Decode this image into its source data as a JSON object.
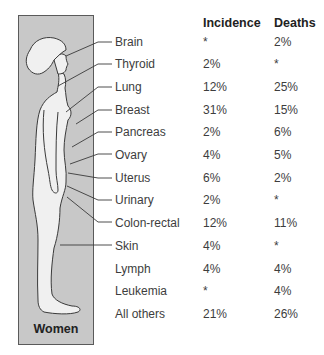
{
  "figure": {
    "caption": "Women",
    "colors": {
      "background": "#c8c8c8",
      "body": "#f0f0f0",
      "outline": "#3a3a3a",
      "border": "#5a5a5a"
    }
  },
  "table": {
    "headers": {
      "site": "",
      "incidence": "Incidence",
      "deaths": "Deaths"
    },
    "rows": [
      {
        "site": "Brain",
        "incidence": "*",
        "deaths": "2%"
      },
      {
        "site": "Thyroid",
        "incidence": "2%",
        "deaths": "*"
      },
      {
        "site": "Lung",
        "incidence": "12%",
        "deaths": "25%"
      },
      {
        "site": "Breast",
        "incidence": "31%",
        "deaths": "15%"
      },
      {
        "site": "Pancreas",
        "incidence": "2%",
        "deaths": "6%"
      },
      {
        "site": "Ovary",
        "incidence": "4%",
        "deaths": "5%"
      },
      {
        "site": "Uterus",
        "incidence": "6%",
        "deaths": "2%"
      },
      {
        "site": "Urinary",
        "incidence": "2%",
        "deaths": "*"
      },
      {
        "site": "Colon-rectal",
        "incidence": "12%",
        "deaths": "11%"
      },
      {
        "site": "Skin",
        "incidence": "4%",
        "deaths": "*"
      },
      {
        "site": "Lymph",
        "incidence": "4%",
        "deaths": "4%"
      },
      {
        "site": "Leukemia",
        "incidence": "*",
        "deaths": "4%"
      },
      {
        "site": "All others",
        "incidence": "21%",
        "deaths": "26%"
      }
    ]
  }
}
